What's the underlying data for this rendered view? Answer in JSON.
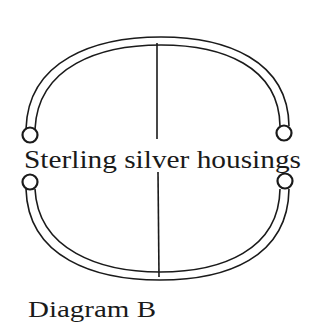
{
  "diagram": {
    "center_label": "Sterling silver housings",
    "caption": "Diagram B",
    "stroke_color": "#1a1a1a",
    "background": "#ffffff"
  }
}
